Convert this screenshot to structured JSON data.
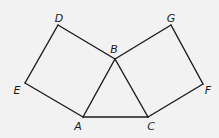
{
  "diagram": {
    "title": "",
    "background": "#f2f2f2",
    "line_color": "#1a1a1a",
    "vertices": {
      "A": {
        "x": 83,
        "y": 117,
        "label": "A",
        "lx": 78,
        "ly": 130
      },
      "B": {
        "x": 115,
        "y": 59,
        "label": "B",
        "lx": 114,
        "ly": 53
      },
      "C": {
        "x": 148,
        "y": 117,
        "label": "C",
        "lx": 151,
        "ly": 130
      },
      "D": {
        "x": 58,
        "y": 25,
        "label": "D",
        "lx": 59,
        "ly": 22
      },
      "E": {
        "x": 25,
        "y": 83,
        "label": "E",
        "lx": 17,
        "ly": 94
      },
      "F": {
        "x": 203,
        "y": 84,
        "label": "F",
        "lx": 208,
        "ly": 94
      },
      "G": {
        "x": 171,
        "y": 25,
        "label": "G",
        "lx": 171,
        "ly": 22
      }
    },
    "shapes": [
      {
        "name": "triangle-ABC",
        "type": "triangle",
        "vertices": [
          "A",
          "B",
          "C"
        ]
      },
      {
        "name": "square-ABDE",
        "type": "square",
        "vertices": [
          "A",
          "B",
          "D",
          "E"
        ]
      },
      {
        "name": "square-BCFG",
        "type": "square",
        "vertices": [
          "B",
          "C",
          "F",
          "G"
        ]
      }
    ],
    "edges": [
      [
        "A",
        "B"
      ],
      [
        "B",
        "C"
      ],
      [
        "C",
        "A"
      ],
      [
        "B",
        "D"
      ],
      [
        "D",
        "E"
      ],
      [
        "E",
        "A"
      ],
      [
        "B",
        "G"
      ],
      [
        "G",
        "F"
      ],
      [
        "F",
        "C"
      ]
    ]
  }
}
